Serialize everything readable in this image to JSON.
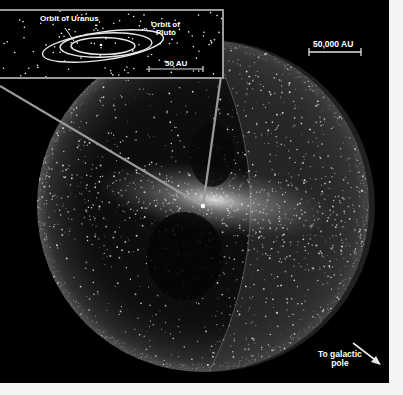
{
  "figure": {
    "colors": {
      "background": "#000000",
      "page_margin": "#f4f4f2",
      "inset_border": "#9a9a9a",
      "label": "#ffffff",
      "dots": "#e8e8e8"
    }
  },
  "inset": {
    "labels": {
      "uranus_orbit": "Orbit of Uranus",
      "pluto_orbit_line1": "Orbit of",
      "pluto_orbit_line2": "Pluto"
    },
    "scale_bar": {
      "label": "50 AU"
    }
  },
  "main": {
    "scale_bar": {
      "label": "50,000 AU"
    },
    "direction": {
      "label_line1": "To galactic",
      "label_line2": "pole",
      "icon": "arrow-down-right-icon"
    }
  }
}
